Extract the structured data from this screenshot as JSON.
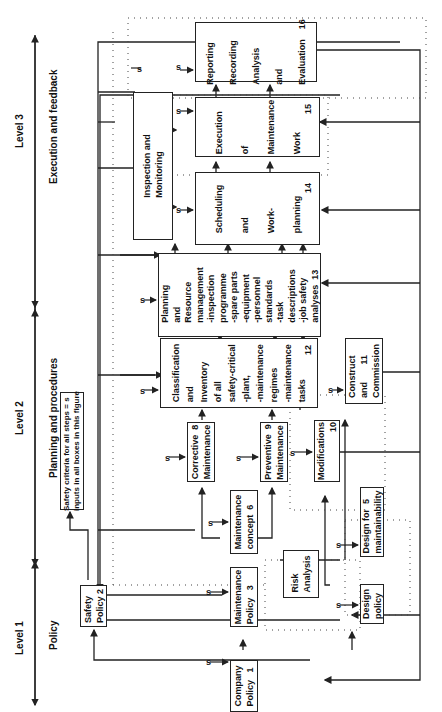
{
  "levels": [
    {
      "label": "Level 1",
      "title": "Policy"
    },
    {
      "label": "Level 2",
      "title": "Planning and procedures"
    },
    {
      "label": "Level 3",
      "title": "Execution and feedback"
    }
  ],
  "note": {
    "line1": "Safety criteria for all steps = s",
    "line2": "inputs in all boxes in this figure"
  },
  "input_marker": "s",
  "boxes": {
    "b1": {
      "lines": [
        "Company",
        "Policy"
      ],
      "num": "1"
    },
    "b2": {
      "lines": [
        "Safety",
        "Policy"
      ],
      "num": "2"
    },
    "b3": {
      "lines": [
        "Maintenance",
        "Policy"
      ],
      "num": "3"
    },
    "b4": {
      "lines": [
        "Design",
        "policy"
      ],
      "num": ""
    },
    "b5": {
      "lines": [
        "Design for",
        "maintainability"
      ],
      "num": "5"
    },
    "b6": {
      "lines": [
        "Maintenance",
        "concept"
      ],
      "num": "6"
    },
    "b8": {
      "lines": [
        "Corrective",
        "Maintenance"
      ],
      "num": "8"
    },
    "b9": {
      "lines": [
        "Preventive",
        "Maintenance"
      ],
      "num": "9"
    },
    "b10": {
      "lines": [
        "Modifications"
      ],
      "num": "10"
    },
    "b11": {
      "lines": [
        "Construct",
        "and",
        "Commission"
      ],
      "num": "11"
    },
    "b12": {
      "lines": [
        "Classification",
        "and",
        "Inventory",
        "of all",
        "safety-critical",
        "-plant,",
        "-maintenance",
        "regimes",
        "-maintenance",
        "tasks"
      ],
      "num": "12"
    },
    "b13": {
      "lines": [
        "Planning",
        "and",
        "Resource",
        "management",
        "-inspection",
        "programme",
        "-spare parts",
        "-equipment",
        "-personnel",
        "standards",
        "-task",
        "descriptions",
        "-job safety",
        "analyses"
      ],
      "num": "13"
    },
    "b14": {
      "lines": [
        "Scheduling",
        "and",
        "Work-",
        "planning"
      ],
      "num": "14"
    },
    "b15": {
      "lines": [
        "Execution",
        "of",
        "Maintenance",
        "Work"
      ],
      "num": "15"
    },
    "b16": {
      "lines": [
        "Reporting",
        "Recording",
        "Analysis",
        "and",
        "Evaluation"
      ],
      "num": "16"
    },
    "im": {
      "lines": [
        "Inspection and",
        "Monitoring"
      ],
      "num": ""
    },
    "ra": {
      "lines": [
        "Risk",
        "Analysis"
      ],
      "num": ""
    }
  }
}
